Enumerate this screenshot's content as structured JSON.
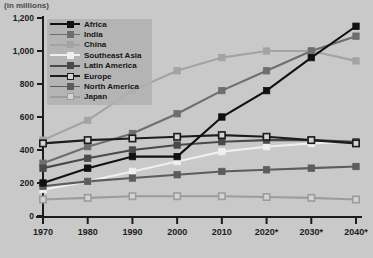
{
  "title": "(in millions)",
  "axis": {
    "y_ticks": [
      "0",
      "200",
      "400",
      "600",
      "800",
      "1,000",
      "1,200"
    ],
    "x_ticks": [
      "1970",
      "1980",
      "1990",
      "2000",
      "2010",
      "2020*",
      "2030*",
      "2040*"
    ]
  },
  "legend": {
    "items": [
      {
        "label": "Africa",
        "color": "#111111",
        "marker": "filled"
      },
      {
        "label": "India",
        "color": "#6e6e6e",
        "marker": "filled"
      },
      {
        "label": "China",
        "color": "#a3a3a3",
        "marker": "filled"
      },
      {
        "label": "Southeast Asia",
        "color": "#efefef",
        "marker": "filled"
      },
      {
        "label": "Latin America",
        "color": "#4a4a4a",
        "marker": "filled"
      },
      {
        "label": "Europe",
        "color": "#1c1c1c",
        "marker": "hollow"
      },
      {
        "label": "North America",
        "color": "#5c5c5c",
        "marker": "filled"
      },
      {
        "label": "Japan",
        "color": "#9c9c9c",
        "marker": "hollow"
      }
    ]
  },
  "chart_data": {
    "type": "line",
    "title": "(in millions)",
    "xlabel": "",
    "ylabel": "",
    "ylim": [
      0,
      1200
    ],
    "grid": false,
    "legend_position": "top-left",
    "x": [
      "1970",
      "1980",
      "1990",
      "2000",
      "2010",
      "2020*",
      "2030*",
      "2040*"
    ],
    "series": [
      {
        "name": "Africa",
        "color": "#111111",
        "marker": "filled",
        "values": [
          200,
          290,
          360,
          360,
          600,
          760,
          960,
          1150
        ]
      },
      {
        "name": "India",
        "color": "#6e6e6e",
        "marker": "filled",
        "values": [
          320,
          420,
          500,
          620,
          760,
          880,
          1000,
          1090
        ]
      },
      {
        "name": "China",
        "color": "#a3a3a3",
        "marker": "filled",
        "values": [
          460,
          580,
          760,
          880,
          960,
          1000,
          1000,
          940
        ]
      },
      {
        "name": "Southeast Asia",
        "color": "#efefef",
        "marker": "filled",
        "values": [
          160,
          210,
          270,
          330,
          390,
          420,
          440,
          450
        ]
      },
      {
        "name": "Latin America",
        "color": "#4a4a4a",
        "marker": "filled",
        "values": [
          290,
          350,
          400,
          430,
          450,
          460,
          460,
          450
        ]
      },
      {
        "name": "Europe",
        "color": "#1c1c1c",
        "marker": "hollow",
        "values": [
          440,
          460,
          470,
          480,
          490,
          480,
          460,
          440
        ]
      },
      {
        "name": "North America",
        "color": "#5c5c5c",
        "marker": "filled",
        "values": [
          180,
          210,
          230,
          250,
          270,
          280,
          290,
          300
        ]
      },
      {
        "name": "Japan",
        "color": "#9c9c9c",
        "marker": "hollow",
        "values": [
          100,
          110,
          120,
          120,
          120,
          115,
          110,
          100
        ]
      }
    ]
  }
}
